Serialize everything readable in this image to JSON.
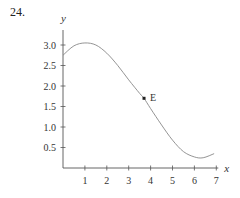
{
  "problem": {
    "number": "24."
  },
  "chart_data": {
    "type": "line",
    "title": "",
    "xlabel": "x",
    "ylabel": "y",
    "xlim": [
      0,
      7
    ],
    "ylim": [
      0,
      3.2
    ],
    "x_ticks": [
      "1",
      "2",
      "3",
      "4",
      "5",
      "6",
      "7"
    ],
    "y_ticks": [
      "0.5",
      "1.0",
      "1.5",
      "2.0",
      "2.5",
      "3.0"
    ],
    "grid": false,
    "series": [
      {
        "name": "curve",
        "x": [
          0,
          0.5,
          1,
          1.5,
          2,
          2.5,
          3,
          3.5,
          3.7,
          4,
          4.5,
          5,
          5.5,
          6,
          6.4,
          6.9
        ],
        "y": [
          2.75,
          2.98,
          3.05,
          3.0,
          2.8,
          2.5,
          2.15,
          1.82,
          1.7,
          1.45,
          1.05,
          0.68,
          0.4,
          0.27,
          0.25,
          0.35
        ]
      }
    ],
    "annotations": [
      {
        "label": "E",
        "x": 3.7,
        "y": 1.7,
        "marker": "point"
      }
    ]
  }
}
